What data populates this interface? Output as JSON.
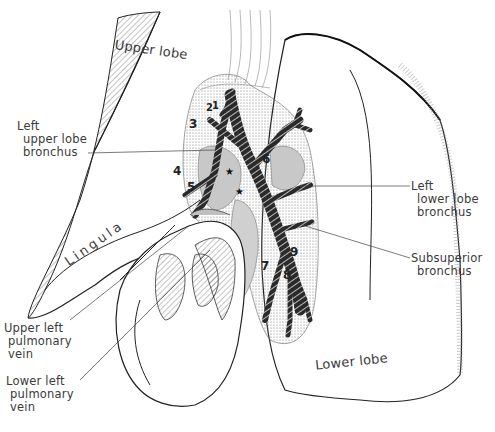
{
  "figure": {
    "labels": {
      "upper_lobe": "Upper lobe",
      "lingula": "Lingula",
      "lower_lobe": "Lower lobe",
      "left_upper_lobe_bronchus": [
        "Left",
        "upper lobe",
        "bronchus"
      ],
      "left_lower_lobe_bronchus": [
        "Left",
        "lower lobe",
        "bronchus"
      ],
      "subsuperior_bronchus": [
        "Subsuperior",
        "bronchus"
      ],
      "upper_left_pulmonary_vein": [
        "Upper left",
        "pulmonary",
        "vein"
      ],
      "lower_left_pulmonary_vein": [
        "Lower left",
        "pulmonary",
        "vein"
      ]
    },
    "segment_numbers": [
      "1",
      "2",
      "3",
      "4",
      "5",
      "6",
      "7",
      "8",
      "9"
    ],
    "markers": [
      "★",
      "★"
    ],
    "colors": {
      "ink": "#1a1a1a",
      "vessel_gray": "#b8b8b8",
      "stipple": "#8a8a8a",
      "background": "#ffffff"
    }
  }
}
